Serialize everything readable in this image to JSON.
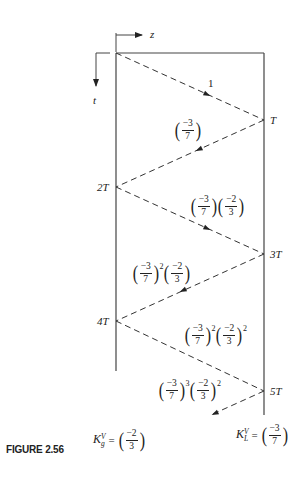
{
  "figure": {
    "caption": "FIGURE 2.56",
    "axes": {
      "z_label": "z",
      "t_label": "t"
    },
    "time_markers": [
      {
        "label": "T",
        "side": "right"
      },
      {
        "label": "2T",
        "side": "left"
      },
      {
        "label": "3T",
        "side": "right"
      },
      {
        "label": "4T",
        "side": "left"
      },
      {
        "label": "5T",
        "side": "right"
      }
    ],
    "wave_labels": [
      {
        "id": "w1",
        "text": "1"
      },
      {
        "id": "w2",
        "text": "(−3/7)",
        "num1": "−3",
        "den1": "7"
      },
      {
        "id": "w3",
        "text": "(−3/7)(−2/3)",
        "num1": "−3",
        "den1": "7",
        "num2": "−2",
        "den2": "3"
      },
      {
        "id": "w4",
        "text": "(−3/7)^2(−2/3)",
        "num1": "−3",
        "den1": "7",
        "exp1": "2",
        "num2": "−2",
        "den2": "3"
      },
      {
        "id": "w5",
        "text": "(−3/7)^2(−2/3)^2",
        "num1": "−3",
        "den1": "7",
        "exp1": "2",
        "num2": "−2",
        "den2": "3",
        "exp2": "2"
      },
      {
        "id": "w6",
        "text": "(−3/7)^3(−2/3)^2",
        "num1": "−3",
        "den1": "7",
        "exp1": "3",
        "num2": "−2",
        "den2": "3",
        "exp2": "2"
      }
    ],
    "source_coefficient": {
      "symbol": "K",
      "sup": "V",
      "sub": "g",
      "eq": "=",
      "num": "−2",
      "den": "3"
    },
    "load_coefficient": {
      "symbol": "K",
      "sup": "V",
      "sub": "L",
      "eq": "=",
      "num": "−3",
      "den": "7"
    }
  }
}
